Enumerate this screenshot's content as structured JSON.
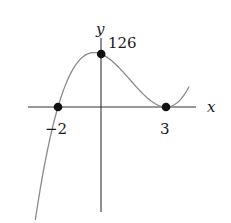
{
  "chart_data": {
    "type": "line",
    "title": "",
    "xlabel": "x",
    "ylabel": "y",
    "function": "f(x) = 7(x+2)(x-3)^2",
    "x_range": [
      -3.05,
      4.07
    ],
    "points": [
      {
        "x": -2,
        "y": 0,
        "label": "−2"
      },
      {
        "x": 0,
        "y": 126,
        "label": "126"
      },
      {
        "x": 3,
        "y": 0,
        "label": "3"
      }
    ],
    "x_intercepts": [
      -2,
      3
    ],
    "y_intercept": 126,
    "grid": false,
    "legend": false
  },
  "labels": {
    "x_axis": "x",
    "y_axis": "y",
    "y_intercept": "126",
    "x_neg2": "−2",
    "x_3": "3"
  },
  "colors": {
    "curve": "#8a8a8a",
    "axes": "#333333",
    "points": "#111111"
  }
}
